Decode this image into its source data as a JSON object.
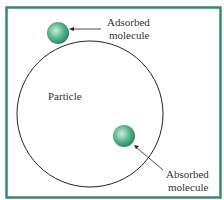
{
  "diagram": {
    "labels": {
      "adsorbed_line1": "Adsorbed",
      "adsorbed_line2": "molecule",
      "particle": "Particle",
      "absorbed_line1": "Absorbed",
      "absorbed_line2": "molecule"
    },
    "colors": {
      "frame": "#3a8a68",
      "molecule": "#4caf85",
      "outline": "#222222"
    }
  }
}
